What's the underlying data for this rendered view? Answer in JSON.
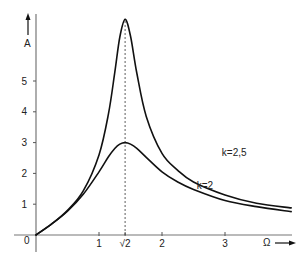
{
  "chart_data": {
    "type": "line",
    "title": "",
    "xlabel": "Ω",
    "ylabel": "A",
    "xlim": [
      0,
      4.05
    ],
    "ylim": [
      0,
      7.0
    ],
    "grid": false,
    "x_ticks": [
      {
        "value": 1,
        "label": "1"
      },
      {
        "value": 1.41421,
        "label": "√2"
      },
      {
        "value": 2,
        "label": "2"
      },
      {
        "value": 3,
        "label": "3"
      }
    ],
    "y_ticks": [
      {
        "value": 1,
        "label": "1"
      },
      {
        "value": 2,
        "label": "2"
      },
      {
        "value": 3,
        "label": "3"
      },
      {
        "value": 4,
        "label": "4"
      },
      {
        "value": 5,
        "label": "5"
      }
    ],
    "origin_label": "0",
    "guide_line": {
      "x": 1.41421,
      "style": "dashed"
    },
    "x": [
      0,
      0.25,
      0.5,
      0.75,
      1,
      1.15,
      1.25,
      1.33,
      1.41421,
      1.5,
      1.6,
      1.75,
      2,
      2.25,
      2.5,
      3,
      3.5,
      4.05
    ],
    "series": [
      {
        "name": "k=2,5",
        "values": [
          0,
          0.36,
          0.8,
          1.43,
          2.6,
          3.93,
          5.27,
          6.42,
          7.0,
          6.46,
          5.26,
          3.85,
          2.65,
          2.1,
          1.72,
          1.3,
          1.03,
          0.88
        ]
      },
      {
        "name": "k=2",
        "values": [
          0,
          0.36,
          0.77,
          1.32,
          2.05,
          2.54,
          2.81,
          2.95,
          3.0,
          2.95,
          2.81,
          2.52,
          2.05,
          1.72,
          1.48,
          1.12,
          0.92,
          0.76
        ]
      }
    ],
    "annotations": [
      {
        "text": "k=2,5",
        "x": 2.95,
        "y": 2.55
      },
      {
        "text": "k=2",
        "x": 2.55,
        "y": 1.5
      }
    ]
  },
  "labels": {
    "y_axis": "A",
    "x_axis": "Ω",
    "origin": "0"
  }
}
